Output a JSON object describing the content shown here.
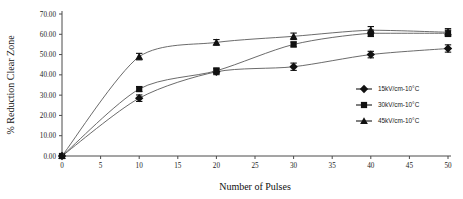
{
  "chart_data": {
    "type": "line",
    "title": "",
    "xlabel": "Number of Pulses",
    "ylabel": "% Reduction Clear Zone",
    "x": [
      0,
      10,
      20,
      30,
      40,
      50
    ],
    "xlim": [
      0,
      50
    ],
    "ylim": [
      0,
      70
    ],
    "xticks": [
      "0",
      "5",
      "10",
      "15",
      "20",
      "25",
      "30",
      "35",
      "40",
      "45",
      "50"
    ],
    "xtick_values": [
      0,
      5,
      10,
      15,
      20,
      25,
      30,
      35,
      40,
      45,
      50
    ],
    "yticks": [
      "0.00",
      "10.00",
      "20.00",
      "30.00",
      "40.00",
      "50.00",
      "60.00",
      "70.00"
    ],
    "ytick_values": [
      0,
      10,
      20,
      30,
      40,
      50,
      60,
      70
    ],
    "grid": false,
    "legend_position": "right-inside",
    "series": [
      {
        "name": "15kV/cm-10°C",
        "marker": "diamond",
        "values": [
          0.0,
          28.5,
          41.5,
          44.0,
          50.0,
          53.0
        ],
        "errors": [
          0.0,
          1.6,
          1.4,
          1.8,
          1.6,
          1.8
        ]
      },
      {
        "name": "30kV/cm-10°C",
        "marker": "square",
        "values": [
          0.0,
          33.0,
          42.0,
          55.0,
          60.5,
          60.5
        ],
        "errors": [
          0.0,
          1.2,
          1.4,
          1.2,
          1.6,
          1.6
        ]
      },
      {
        "name": "45kV/cm-10°C",
        "marker": "triangle",
        "values": [
          0.0,
          49.0,
          56.0,
          59.0,
          62.0,
          61.0
        ],
        "errors": [
          0.0,
          1.6,
          1.4,
          1.6,
          1.8,
          1.8
        ]
      }
    ]
  },
  "legend": {
    "entries": [
      {
        "label": "15kV/cm-10°C",
        "marker": "diamond"
      },
      {
        "label": "30kV/cm-10°C",
        "marker": "square"
      },
      {
        "label": "45kV/cm-10°C",
        "marker": "triangle"
      }
    ]
  },
  "colors": {
    "ink": "#111111",
    "axis": "#4a4a4a",
    "line": "#5a5a5a",
    "background": "#ffffff"
  }
}
